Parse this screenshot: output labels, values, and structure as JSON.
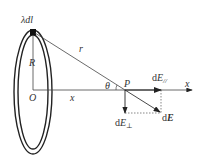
{
  "diagram": {
    "labels": {
      "charge_element": "λdl",
      "radius": "R",
      "distance_r": "r",
      "origin": "O",
      "axis_distance": "x",
      "axis_name": "x",
      "angle": "θ",
      "point": "P",
      "field_parallel_d": "d",
      "field_parallel_E": "E",
      "field_parallel_sub": "//",
      "field_perp_d": "d",
      "field_perp_E": "E",
      "field_perp_sub": "⊥",
      "field_total_d": "d",
      "field_total_E": "E"
    },
    "colors": {
      "stroke": "#222222",
      "label": "#333333",
      "background": "#ffffff"
    }
  }
}
